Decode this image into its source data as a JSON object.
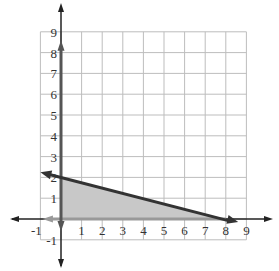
{
  "chart_data": {
    "type": "area",
    "title": "",
    "xlabel": "",
    "ylabel": "",
    "xlim": [
      -1,
      9
    ],
    "ylim": [
      -1,
      9
    ],
    "grid": true,
    "x_ticks": [
      "-1",
      "1",
      "2",
      "3",
      "4",
      "5",
      "6",
      "7",
      "8",
      "9"
    ],
    "y_ticks": [
      "-1",
      "1",
      "2",
      "3",
      "4",
      "5",
      "6",
      "7",
      "8",
      "9"
    ],
    "series": [
      {
        "name": "boundary line",
        "kind": "line",
        "points": [
          [
            -1,
            2.25
          ],
          [
            0,
            2
          ],
          [
            8,
            0
          ],
          [
            8.6,
            -0.15
          ]
        ],
        "color": "#333333"
      },
      {
        "name": "feasible region",
        "kind": "shaded_polygon",
        "points": [
          [
            0,
            0
          ],
          [
            0,
            2
          ],
          [
            8,
            0
          ]
        ],
        "color": "#c8c8c8"
      },
      {
        "name": "y >= 0 boundary",
        "kind": "line",
        "points": [
          [
            -0.9,
            0
          ],
          [
            8,
            0
          ]
        ],
        "color": "#999999"
      },
      {
        "name": "x >= 0 boundary",
        "kind": "line",
        "points": [
          [
            0,
            8.5
          ],
          [
            0,
            -0.6
          ]
        ],
        "color": "#555555"
      }
    ],
    "legend": []
  },
  "axes": {
    "x_labels": [
      "-1",
      "1",
      "2",
      "3",
      "4",
      "5",
      "6",
      "7",
      "8",
      "9"
    ],
    "y_labels": [
      "-1",
      "1",
      "2",
      "3",
      "4",
      "5",
      "6",
      "7",
      "8",
      "9"
    ]
  }
}
